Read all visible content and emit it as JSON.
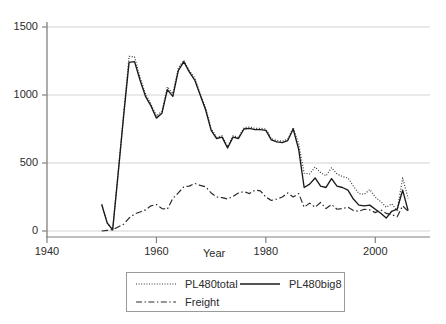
{
  "chart_data": {
    "type": "line",
    "title": "",
    "xlabel": "Year",
    "ylabel": "",
    "xlim": [
      1940,
      2010
    ],
    "ylim": [
      0,
      1500
    ],
    "yticks": [
      0,
      500,
      1000,
      1500
    ],
    "xticks": [
      1940,
      1960,
      1980,
      2000
    ],
    "ytick_labels": [
      "0",
      "500",
      "1000",
      "1500"
    ],
    "xtick_labels": [
      "1940",
      "1960",
      "1980",
      "2000"
    ],
    "grid": true,
    "grid_axis": "y",
    "legend_position": "below",
    "x": [
      1950,
      1951,
      1952,
      1953,
      1954,
      1955,
      1956,
      1957,
      1958,
      1959,
      1960,
      1961,
      1962,
      1963,
      1964,
      1965,
      1966,
      1967,
      1968,
      1969,
      1970,
      1971,
      1972,
      1973,
      1974,
      1975,
      1976,
      1977,
      1978,
      1979,
      1980,
      1981,
      1982,
      1983,
      1984,
      1985,
      1986,
      1987,
      1988,
      1989,
      1990,
      1991,
      1992,
      1993,
      1994,
      1995,
      1996,
      1997,
      1998,
      1999,
      2000,
      2001,
      2002,
      2003,
      2004,
      2005,
      2006
    ],
    "series": [
      {
        "name": "PL480total",
        "style": "dotted",
        "color": "#3a3a3a",
        "values": [
          195,
          60,
          8,
          430,
          860,
          1285,
          1280,
          1130,
          1010,
          935,
          845,
          880,
          1060,
          1010,
          1200,
          1255,
          1180,
          1125,
          1010,
          905,
          755,
          690,
          700,
          620,
          700,
          690,
          760,
          765,
          755,
          755,
          750,
          680,
          665,
          660,
          675,
          760,
          640,
          425,
          420,
          470,
          430,
          405,
          465,
          420,
          400,
          390,
          330,
          275,
          270,
          305,
          250,
          215,
          175,
          200,
          150,
          390,
          240
        ]
      },
      {
        "name": "PL480big8",
        "style": "solid",
        "color": "#1a1a1a",
        "values": [
          195,
          60,
          8,
          420,
          845,
          1240,
          1245,
          1110,
          990,
          920,
          830,
          865,
          1040,
          990,
          1180,
          1245,
          1170,
          1110,
          1000,
          890,
          740,
          680,
          690,
          610,
          690,
          680,
          750,
          755,
          745,
          745,
          740,
          670,
          655,
          650,
          665,
          750,
          600,
          320,
          345,
          390,
          330,
          320,
          385,
          330,
          320,
          300,
          235,
          190,
          185,
          190,
          160,
          130,
          95,
          145,
          160,
          300,
          150
        ]
      },
      {
        "name": "Freight",
        "style": "dashdot",
        "color": "#2a2a2a",
        "values": [
          0,
          5,
          10,
          30,
          50,
          95,
          125,
          140,
          155,
          185,
          195,
          165,
          160,
          240,
          280,
          325,
          330,
          350,
          335,
          325,
          280,
          250,
          245,
          235,
          255,
          280,
          290,
          275,
          300,
          295,
          250,
          225,
          235,
          250,
          280,
          250,
          275,
          175,
          205,
          175,
          210,
          165,
          195,
          160,
          165,
          175,
          150,
          145,
          160,
          155,
          135,
          155,
          130,
          120,
          105,
          185,
          145
        ]
      }
    ]
  },
  "axis": {
    "x_title": "Year",
    "y_ticks": [
      {
        "label": "1500",
        "value": 1500
      },
      {
        "label": "1000",
        "value": 1000
      },
      {
        "label": "500",
        "value": 500
      },
      {
        "label": "0",
        "value": 0
      }
    ],
    "x_ticks": [
      {
        "label": "1940",
        "value": 1940
      },
      {
        "label": "1960",
        "value": 1960
      },
      {
        "label": "1980",
        "value": 1980
      },
      {
        "label": "2000",
        "value": 2000
      }
    ]
  },
  "legend": {
    "entries": [
      {
        "label": "PL480total",
        "style": "dotted"
      },
      {
        "label": "PL480big8",
        "style": "solid"
      },
      {
        "label": "Freight",
        "style": "dashdot"
      }
    ]
  },
  "colors": {
    "background": "#ffffff",
    "axis": "#808080",
    "grid": "#d4d4d4",
    "text": "#2b2b2b",
    "legend_border": "#9a9a9a"
  }
}
